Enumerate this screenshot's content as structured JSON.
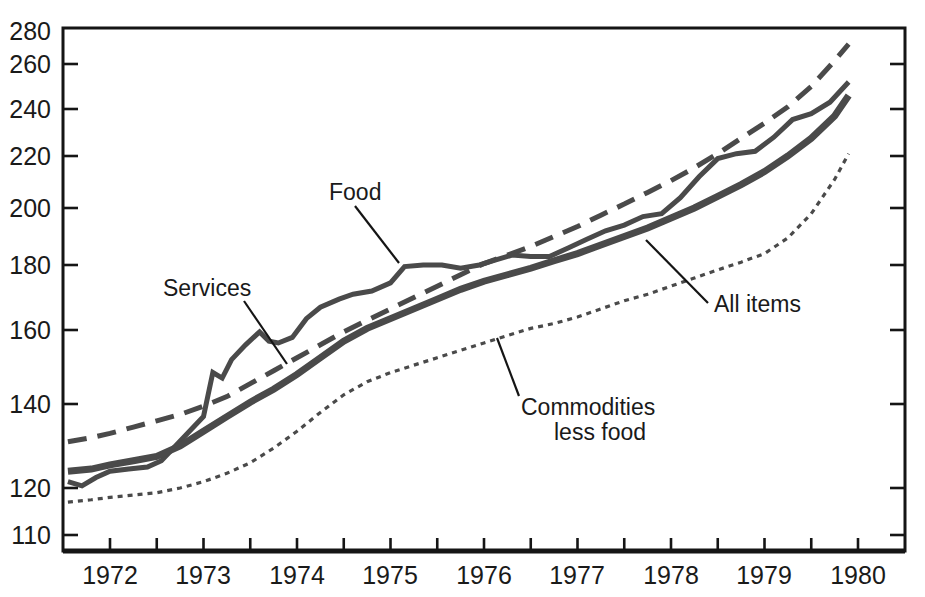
{
  "chart_data": {
    "type": "line",
    "title": "",
    "subtitle": "",
    "xlabel": "",
    "ylabel": "",
    "scale": "ratio",
    "grid": false,
    "legend_position": "inline-annotations",
    "xlim": [
      1971.5,
      1980.5
    ],
    "ylim": [
      110,
      280
    ],
    "x_tick_labels": [
      "1972",
      "1973",
      "1974",
      "1975",
      "1976",
      "1977",
      "1978",
      "1979",
      "1980"
    ],
    "x_tick_values": [
      1972,
      1973,
      1974,
      1975,
      1976,
      1977,
      1978,
      1979,
      1980
    ],
    "x_minor_tick_interval": 0.5,
    "y_tick_labels": [
      "280",
      "260",
      "240",
      "220",
      "200",
      "180",
      "160",
      "140",
      "120",
      "110"
    ],
    "y_tick_values": [
      280,
      260,
      240,
      220,
      200,
      180,
      160,
      140,
      120,
      110
    ],
    "series": [
      {
        "name": "Services",
        "style": "long-dash",
        "color": "#4a4a4a",
        "width": 5.0,
        "dash": "19,11",
        "x": [
          1971.55,
          1971.8,
          1972.0,
          1972.25,
          1972.5,
          1972.75,
          1973.0,
          1973.25,
          1973.5,
          1973.75,
          1974.0,
          1974.25,
          1974.5,
          1974.75,
          1975.0,
          1975.25,
          1975.5,
          1975.75,
          1976.0,
          1976.25,
          1976.5,
          1976.75,
          1977.0,
          1977.25,
          1977.5,
          1977.75,
          1978.0,
          1978.25,
          1978.5,
          1978.75,
          1979.0,
          1979.25,
          1979.5,
          1979.75,
          1979.9
        ],
        "y": [
          131.0,
          132.0,
          133.0,
          134.5,
          136.0,
          137.5,
          139.5,
          142.0,
          145.5,
          149.0,
          152.5,
          156.0,
          159.5,
          163.0,
          166.5,
          170.0,
          173.5,
          177.0,
          180.5,
          183.5,
          186.5,
          190.0,
          193.5,
          197.5,
          201.5,
          206.0,
          210.5,
          215.5,
          221.0,
          227.5,
          234.0,
          241.0,
          250.0,
          262.0,
          272.0
        ]
      },
      {
        "name": "Food",
        "style": "solid-medium",
        "color": "#4a4a4a",
        "width": 5.0,
        "dash": "",
        "x": [
          1971.55,
          1971.7,
          1971.85,
          1972.0,
          1972.2,
          1972.4,
          1972.55,
          1972.7,
          1972.85,
          1973.0,
          1973.1,
          1973.2,
          1973.3,
          1973.45,
          1973.6,
          1973.7,
          1973.8,
          1973.95,
          1974.1,
          1974.25,
          1974.45,
          1974.6,
          1974.8,
          1975.0,
          1975.15,
          1975.35,
          1975.55,
          1975.75,
          1975.95,
          1976.1,
          1976.3,
          1976.5,
          1976.7,
          1976.9,
          1977.1,
          1977.3,
          1977.5,
          1977.7,
          1977.9,
          1978.1,
          1978.3,
          1978.5,
          1978.7,
          1978.9,
          1979.1,
          1979.3,
          1979.5,
          1979.7,
          1979.9
        ],
        "y": [
          121.5,
          120.5,
          122.5,
          124.0,
          124.5,
          125.0,
          126.5,
          130.0,
          133.5,
          137.0,
          148.5,
          147.0,
          152.0,
          156.0,
          159.5,
          157.0,
          156.5,
          158.0,
          163.5,
          167.0,
          169.5,
          171.0,
          172.0,
          174.5,
          179.5,
          180.0,
          180.0,
          179.0,
          180.0,
          181.5,
          183.5,
          183.0,
          183.0,
          186.0,
          189.0,
          192.0,
          194.0,
          197.0,
          198.0,
          204.0,
          212.0,
          219.0,
          221.0,
          222.0,
          228.0,
          235.5,
          238.0,
          243.0,
          252.0
        ]
      },
      {
        "name": "All items",
        "style": "solid-thick",
        "color": "#4a4a4a",
        "width": 7.0,
        "dash": "",
        "x": [
          1971.55,
          1971.8,
          1972.0,
          1972.25,
          1972.5,
          1972.75,
          1973.0,
          1973.25,
          1973.5,
          1973.75,
          1974.0,
          1974.25,
          1974.5,
          1974.75,
          1975.0,
          1975.25,
          1975.5,
          1975.75,
          1976.0,
          1976.25,
          1976.5,
          1976.75,
          1977.0,
          1977.25,
          1977.5,
          1977.75,
          1978.0,
          1978.25,
          1978.5,
          1978.75,
          1979.0,
          1979.25,
          1979.5,
          1979.75,
          1979.9
        ],
        "y": [
          124.0,
          124.5,
          125.5,
          126.5,
          127.5,
          130.0,
          133.5,
          137.0,
          140.5,
          144.0,
          148.0,
          152.5,
          157.0,
          160.5,
          163.5,
          166.5,
          169.5,
          172.5,
          175.0,
          177.0,
          179.0,
          181.5,
          184.0,
          187.0,
          190.0,
          193.0,
          196.5,
          200.0,
          204.5,
          209.0,
          214.0,
          220.0,
          227.5,
          237.0,
          246.0
        ]
      },
      {
        "name": "Commodities less food",
        "style": "fine-dot",
        "color": "#4a4a4a",
        "width": 3.2,
        "dash": "5,5",
        "x": [
          1971.55,
          1971.8,
          1972.0,
          1972.25,
          1972.5,
          1972.75,
          1973.0,
          1973.25,
          1973.5,
          1973.75,
          1974.0,
          1974.25,
          1974.5,
          1974.75,
          1975.0,
          1975.25,
          1975.5,
          1975.75,
          1976.0,
          1976.25,
          1976.5,
          1976.75,
          1977.0,
          1977.25,
          1977.5,
          1977.75,
          1978.0,
          1978.25,
          1978.5,
          1978.75,
          1979.0,
          1979.25,
          1979.5,
          1979.75,
          1979.9
        ],
        "y": [
          117.0,
          117.5,
          118.0,
          118.5,
          119.0,
          120.0,
          121.5,
          123.5,
          126.0,
          129.5,
          133.5,
          138.0,
          142.5,
          146.0,
          148.5,
          150.5,
          152.5,
          154.5,
          156.5,
          158.5,
          160.5,
          162.0,
          164.0,
          166.5,
          169.0,
          171.0,
          173.5,
          176.0,
          178.5,
          181.0,
          184.0,
          189.5,
          198.0,
          211.0,
          221.0
        ]
      }
    ],
    "annotations": [
      {
        "text": "Food",
        "text_lines": [
          "Food"
        ],
        "label_x": 329,
        "label_y": 200,
        "leader_from_x": 355,
        "leader_from_y": 206,
        "leader_to_x": 399,
        "leader_to_y": 263
      },
      {
        "text": "Services",
        "text_lines": [
          "Services"
        ],
        "label_x": 163,
        "label_y": 296,
        "leader_from_x": 244,
        "leader_from_y": 301,
        "leader_to_x": 287,
        "leader_to_y": 364
      },
      {
        "text": "All items",
        "text_lines": [
          "All items"
        ],
        "label_x": 714,
        "label_y": 312,
        "leader_from_x": 708,
        "leader_from_y": 303,
        "leader_to_x": 646,
        "leader_to_y": 240
      },
      {
        "text": "Commodities less food",
        "text_lines": [
          "Commodities",
          "less food"
        ],
        "label_x": 521,
        "label_y": 415,
        "leader_from_x": 519,
        "leader_from_y": 396,
        "leader_to_x": 497,
        "leader_to_y": 338
      }
    ]
  },
  "axes": {
    "y_ticks": [
      {
        "label": "280",
        "value": 280,
        "py": 31
      },
      {
        "label": "260",
        "value": 260,
        "py": 64
      },
      {
        "label": "240",
        "value": 240,
        "py": 109
      },
      {
        "label": "220",
        "value": 220,
        "py": 156
      },
      {
        "label": "200",
        "value": 200,
        "py": 208
      },
      {
        "label": "180",
        "value": 180,
        "py": 265
      },
      {
        "label": "160",
        "value": 160,
        "py": 330
      },
      {
        "label": "140",
        "value": 140,
        "py": 404
      },
      {
        "label": "120",
        "value": 120,
        "py": 488
      },
      {
        "label": "110",
        "value": 110,
        "py": 535
      }
    ],
    "x_ticks": [
      {
        "label": "1972",
        "value": 1972,
        "px": 110
      },
      {
        "label": "1973",
        "value": 1973,
        "px": 203
      },
      {
        "label": "1974",
        "value": 1974,
        "px": 297
      },
      {
        "label": "1975",
        "value": 1975,
        "px": 390
      },
      {
        "label": "1976",
        "value": 1976,
        "px": 484
      },
      {
        "label": "1977",
        "value": 1977,
        "px": 577
      },
      {
        "label": "1978",
        "value": 1978,
        "px": 671
      },
      {
        "label": "1979",
        "value": 1979,
        "px": 764
      },
      {
        "label": "1980",
        "value": 1980,
        "px": 858
      }
    ],
    "plot_left": 63,
    "plot_right": 905,
    "plot_top": 28,
    "plot_bottom": 551
  },
  "colors": {
    "line": "#4a4a4a",
    "axis": "#151515",
    "text": "#1a1a1a",
    "background": "#ffffff"
  }
}
